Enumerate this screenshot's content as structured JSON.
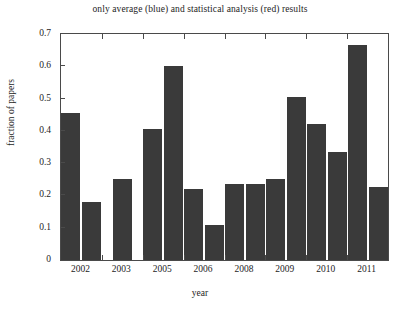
{
  "chart_data": {
    "type": "bar",
    "title": "only average (blue) and statistical analysis (red) results",
    "xlabel": "year",
    "ylabel": "fraction of papers",
    "categories": [
      "2002",
      "2003",
      "2005",
      "2006",
      "2008",
      "2009",
      "2010",
      "2011"
    ],
    "series": [
      {
        "name": "only average (blue)",
        "values": [
          0.455,
          0.25,
          0.405,
          0.22,
          0.235,
          0.25,
          0.42,
          0.665
        ]
      },
      {
        "name": "statistical analysis (red)",
        "values": [
          0.18,
          null,
          0.6,
          0.11,
          0.235,
          0.505,
          0.335,
          0.225
        ]
      }
    ],
    "ylim": [
      0,
      0.7
    ],
    "ytick_labels": [
      "0",
      "0.1",
      "0.2",
      "0.3",
      "0.4",
      "0.5",
      "0.6",
      "0.7"
    ],
    "ytick_values": [
      0,
      0.1,
      0.2,
      0.3,
      0.4,
      0.5,
      0.6,
      0.7
    ],
    "grid": false,
    "legend": "none",
    "bar_color": "#3a3a3a",
    "axis_color": "#4a4a4a",
    "background": "#ffffff"
  }
}
